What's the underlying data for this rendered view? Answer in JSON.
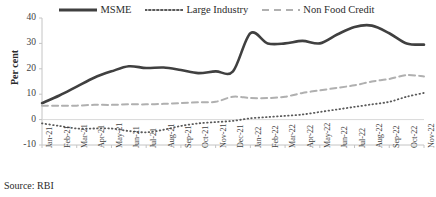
{
  "source_note": "Source: RBI",
  "legend": {
    "items": [
      {
        "label": "MSME",
        "key": "solid-thick-line",
        "color": "#404040"
      },
      {
        "label": "Large Industry",
        "key": "dotted-line",
        "color": "#5a5a5a"
      },
      {
        "label": "Non Food Credit",
        "key": "dashed-line",
        "color": "#b0b0b0"
      }
    ]
  },
  "axes": {
    "ylabel": "Per cent",
    "yticks": [
      "40",
      "30",
      "20",
      "10",
      "0",
      "-10"
    ],
    "xticks": [
      "Jan-21",
      "Feb-21",
      "Mar-21",
      "Apr-21",
      "May-21",
      "Jun-21",
      "Jul-21",
      "Aug-21",
      "Sep-21",
      "Oct-21",
      "Nov-21",
      "Dec-21",
      "Jan-22",
      "Feb-22",
      "Mar-22",
      "Apr-22",
      "May-22",
      "Jun-22",
      "Jul-22",
      "Aug-22",
      "Sep-22",
      "Oct-22",
      "Nov-22"
    ]
  },
  "chart_data": {
    "type": "line",
    "title": "",
    "xlabel": "",
    "ylabel": "Per cent",
    "ylim": [
      -10,
      40
    ],
    "yticks": [
      -10,
      0,
      10,
      20,
      30,
      40
    ],
    "grid": false,
    "legend_position": "top",
    "categories": [
      "Jan-21",
      "Feb-21",
      "Mar-21",
      "Apr-21",
      "May-21",
      "Jun-21",
      "Jul-21",
      "Aug-21",
      "Sep-21",
      "Oct-21",
      "Nov-21",
      "Dec-21",
      "Jan-22",
      "Feb-22",
      "Mar-22",
      "Apr-22",
      "May-22",
      "Jun-22",
      "Jul-22",
      "Aug-22",
      "Sep-22",
      "Oct-22",
      "Nov-22"
    ],
    "series": [
      {
        "name": "MSME",
        "style": "solid",
        "color": "#404040",
        "width": 2.6,
        "values": [
          6.5,
          9.5,
          13.0,
          16.5,
          19.0,
          21.0,
          20.3,
          20.5,
          19.5,
          18.3,
          19.0,
          19.0,
          34.0,
          30.0,
          30.0,
          31.0,
          30.0,
          33.5,
          36.5,
          37.0,
          34.0,
          30.0,
          29.5
        ]
      },
      {
        "name": "Large Industry",
        "style": "dotted",
        "color": "#5a5a5a",
        "width": 1.8,
        "values": [
          -1.5,
          -2.5,
          -3.5,
          -3.5,
          -3.5,
          -4.5,
          -5.0,
          -4.0,
          -2.5,
          -1.5,
          -1.0,
          -0.5,
          0.5,
          1.0,
          1.5,
          2.0,
          3.0,
          4.0,
          5.0,
          6.0,
          7.0,
          9.0,
          10.5
        ]
      },
      {
        "name": "Non Food Credit",
        "style": "dashed",
        "color": "#b0b0b0",
        "width": 2.0,
        "values": [
          5.5,
          5.5,
          5.5,
          5.8,
          5.8,
          6.0,
          6.0,
          6.2,
          6.5,
          6.8,
          7.0,
          9.0,
          8.5,
          8.5,
          9.0,
          10.5,
          11.5,
          12.5,
          13.5,
          15.0,
          16.0,
          17.5,
          17.0
        ]
      }
    ]
  },
  "plot_geometry": {
    "left": 42,
    "right": 424,
    "top": 18,
    "bottom": 145,
    "y_max": 40,
    "y_min": -10
  }
}
